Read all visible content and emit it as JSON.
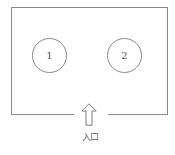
{
  "diagram": {
    "type": "floor-plan",
    "room": {
      "border_color": "#8a8a8a",
      "has_opening_at": "bottom-center"
    },
    "stations": [
      {
        "label": "1"
      },
      {
        "label": "2"
      }
    ],
    "entrance": {
      "icon": "up-arrow-icon",
      "label": "入口"
    }
  }
}
